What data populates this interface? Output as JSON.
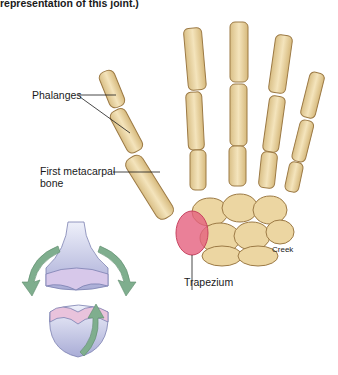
{
  "figure": {
    "caption_fragment": "representation of this joint.)",
    "labels": {
      "phalanges": "Phalanges",
      "first_metacarpal_line1": "First metacarpal",
      "first_metacarpal_line2": "bone",
      "trapezium": "Trapezium"
    },
    "credit": "Creek",
    "colors": {
      "bone": "#efdcae",
      "bone_shadow": "#c9aa70",
      "bone_outline": "#9c7a45",
      "trapezium": "#e5607e",
      "joint_model": "#c9cbe8",
      "joint_model_pink": "#e9c3dc",
      "arrow": "#7fae8e"
    }
  }
}
